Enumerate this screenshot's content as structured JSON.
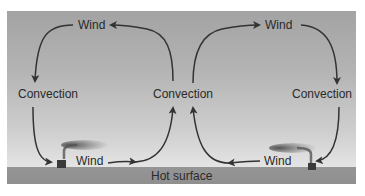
{
  "diagram": {
    "labels": {
      "wind_top_left": "Wind",
      "wind_top_right": "Wind",
      "convection_left": "Convection",
      "convection_center": "Convection",
      "convection_right": "Convection",
      "wind_bottom_left": "Wind",
      "wind_bottom_right": "Wind",
      "surface": "Hot surface"
    },
    "colors": {
      "sky_top": "#a3a3a3",
      "sky_bottom": "#ececec",
      "ground": "#929292",
      "arrow": "#333333",
      "text": "#2a2a2a"
    },
    "cells": [
      {
        "name": "left-cell",
        "direction": "counterclockwise: up at center, left at top, down at left, right at bottom"
      },
      {
        "name": "right-cell",
        "direction": "clockwise: up at center, right at top, down at right, left at bottom"
      }
    ]
  }
}
